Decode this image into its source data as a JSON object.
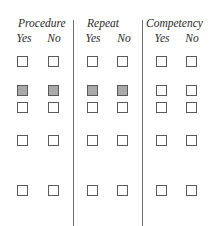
{
  "groups": [
    {
      "title": "Procedure",
      "columns": [
        "Yes",
        "No"
      ]
    },
    {
      "title": "Repeat",
      "columns": [
        "Yes",
        "No"
      ]
    },
    {
      "title": "Competency",
      "columns": [
        "Yes",
        "No"
      ]
    }
  ],
  "rows": [
    {
      "shaded": [
        false,
        false,
        false,
        false,
        false,
        false
      ]
    },
    {
      "shaded": [
        true,
        true,
        true,
        true,
        false,
        false
      ]
    },
    {
      "shaded": [
        false,
        false,
        false,
        false,
        false,
        false
      ]
    },
    {
      "shaded": [
        false,
        false,
        false,
        false,
        false,
        false
      ]
    },
    {
      "shaded": [
        false,
        false,
        false,
        false,
        false,
        false
      ]
    }
  ],
  "colors": {
    "line": "#6e6e6e",
    "box_border": "#5a5a5a",
    "shaded_fill": "#a9a9a9"
  }
}
